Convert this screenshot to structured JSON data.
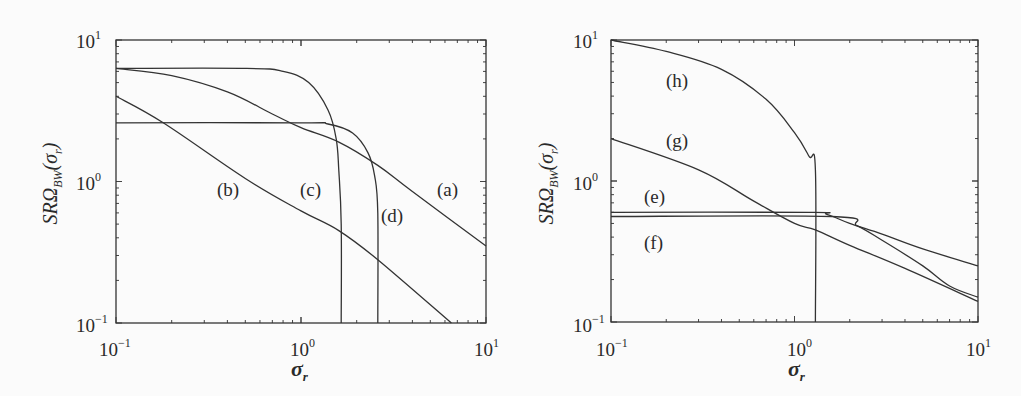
{
  "chart_data": [
    {
      "type": "line",
      "panel": "left",
      "title": "",
      "xlabel": "σ_r",
      "ylabel": "SRΩ_BW(σ_r)",
      "xscale": "log",
      "yscale": "log",
      "xlim": [
        0.1,
        10
      ],
      "ylim": [
        0.1,
        10
      ],
      "x_ticks": [
        "10^-1",
        "10^0",
        "10^1"
      ],
      "y_ticks": [
        "10^-1",
        "10^0",
        "10^1"
      ],
      "grid": false,
      "series": [
        {
          "name": "(a)",
          "x": [
            0.1,
            0.2,
            0.4,
            0.7,
            1.0,
            1.6,
            2.6,
            4.0,
            10
          ],
          "y": [
            6.3,
            5.6,
            4.3,
            3.0,
            2.4,
            1.9,
            1.3,
            0.85,
            0.35
          ]
        },
        {
          "name": "(b)",
          "x": [
            0.1,
            0.18,
            0.5,
            1.0,
            1.6,
            2.6,
            6.5
          ],
          "y": [
            4.0,
            2.6,
            1.05,
            0.62,
            0.45,
            0.28,
            0.1
          ]
        },
        {
          "name": "(c)",
          "x": [
            0.1,
            0.5,
            0.8,
            1.1,
            1.4,
            1.55,
            1.6,
            1.65,
            1.65
          ],
          "y": [
            6.3,
            6.3,
            6.0,
            5.0,
            3.2,
            2.0,
            1.2,
            0.5,
            0.1
          ]
        },
        {
          "name": "(d)",
          "x": [
            0.1,
            1.0,
            1.4,
            1.9,
            2.3,
            2.5,
            2.6,
            2.6
          ],
          "y": [
            2.6,
            2.6,
            2.55,
            2.2,
            1.6,
            1.1,
            0.6,
            0.1
          ]
        }
      ],
      "annotations": [
        {
          "text": "(a)",
          "x": 6.0,
          "y": 0.95
        },
        {
          "text": "(b)",
          "x": 0.35,
          "y": 0.95
        },
        {
          "text": "(c)",
          "x": 1.0,
          "y": 0.95
        },
        {
          "text": "(d)",
          "x": 2.8,
          "y": 0.6
        }
      ]
    },
    {
      "type": "line",
      "panel": "right",
      "title": "",
      "xlabel": "σ_r",
      "ylabel": "SRΩ_BW(σ_r)",
      "xscale": "log",
      "yscale": "log",
      "xlim": [
        0.1,
        10
      ],
      "ylim": [
        0.1,
        10
      ],
      "x_ticks": [
        "10^-1",
        "10^0",
        "10^1"
      ],
      "y_ticks": [
        "10^-1",
        "10^0",
        "10^1"
      ],
      "grid": false,
      "series": [
        {
          "name": "(e)",
          "x": [
            0.1,
            1.2,
            1.5,
            2.0,
            3.0,
            5.0,
            10
          ],
          "y": [
            0.6,
            0.6,
            0.58,
            0.5,
            0.42,
            0.33,
            0.25
          ]
        },
        {
          "name": "(f)",
          "x": [
            0.1,
            1.6,
            2.2,
            3.0,
            5.0,
            7.0,
            10
          ],
          "y": [
            0.56,
            0.56,
            0.48,
            0.38,
            0.25,
            0.18,
            0.15
          ]
        },
        {
          "name": "(g)",
          "x": [
            0.1,
            0.3,
            0.6,
            1.0,
            1.3,
            2.0,
            4.0,
            10
          ],
          "y": [
            2.0,
            1.2,
            0.72,
            0.5,
            0.45,
            0.35,
            0.24,
            0.14
          ]
        },
        {
          "name": "(h)",
          "x": [
            0.1,
            0.2,
            0.4,
            0.7,
            1.0,
            1.2,
            1.3,
            1.3
          ],
          "y": [
            10,
            8.3,
            6.2,
            3.8,
            2.2,
            1.5,
            1.2,
            0.1
          ]
        }
      ],
      "annotations": [
        {
          "text": "(e)",
          "x": 0.15,
          "y": 0.78
        },
        {
          "text": "(f)",
          "x": 0.15,
          "y": 0.38
        },
        {
          "text": "(g)",
          "x": 0.3,
          "y": 1.25
        },
        {
          "text": "(h)",
          "x": 0.3,
          "y": 4.5
        }
      ]
    }
  ],
  "panels": {
    "left": {
      "ytick_top": {
        "base": "10",
        "exp": "1"
      },
      "ytick_mid": {
        "base": "10",
        "exp": "0"
      },
      "ytick_bot": {
        "base": "10",
        "exp": "−1"
      },
      "xtick_left": {
        "base": "10",
        "exp": "−1"
      },
      "xtick_mid": {
        "base": "10",
        "exp": "0"
      },
      "xtick_right": {
        "base": "10",
        "exp": "1"
      },
      "xlabel": {
        "main": "σ",
        "sub": "r"
      },
      "ylabel": {
        "main": "SRΩ",
        "sub": "BW",
        "tail": "(σ",
        "sub2": "r",
        "close": ")"
      },
      "labels": {
        "a": "(a)",
        "b": "(b)",
        "c": "(c)",
        "d": "(d)"
      }
    },
    "right": {
      "ytick_top": {
        "base": "10",
        "exp": "1"
      },
      "ytick_mid": {
        "base": "10",
        "exp": "0"
      },
      "ytick_bot": {
        "base": "10",
        "exp": "−1"
      },
      "xtick_left": {
        "base": "10",
        "exp": "−1"
      },
      "xtick_mid": {
        "base": "10",
        "exp": "0"
      },
      "xtick_right": {
        "base": "10",
        "exp": "1"
      },
      "xlabel": {
        "main": "σ",
        "sub": "r"
      },
      "ylabel": {
        "main": "SRΩ",
        "sub": "BW",
        "tail": "(σ",
        "sub2": "r",
        "close": ")"
      },
      "labels": {
        "e": "(e)",
        "f": "(f)",
        "g": "(g)",
        "h": "(h)"
      }
    }
  },
  "colors": {
    "line": "#333333",
    "frame": "#333333",
    "background": "#fbfbfb"
  }
}
